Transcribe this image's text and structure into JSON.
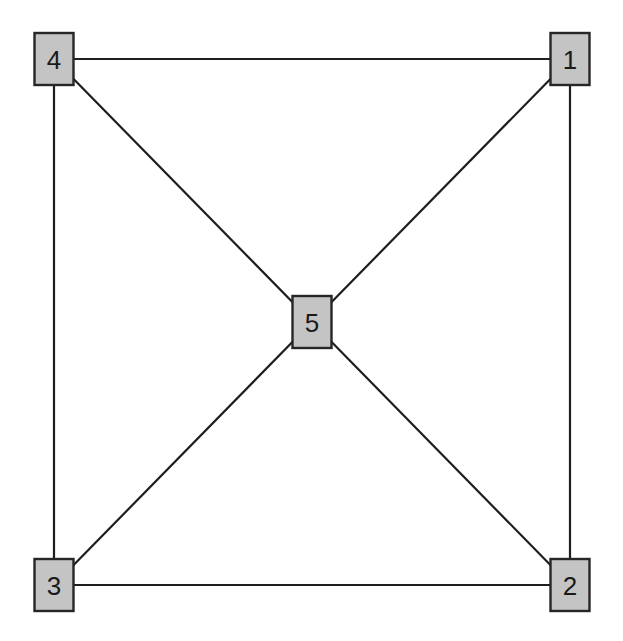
{
  "diagram": {
    "type": "graph",
    "colors": {
      "background": "#ffffff",
      "node_fill": "#c4c4c4",
      "node_stroke": "#262626",
      "edge": "#1e1e1e",
      "label": "#1a1a1a"
    },
    "nodes": [
      {
        "id": "1",
        "label": "1",
        "x": 570,
        "y": 59
      },
      {
        "id": "2",
        "label": "2",
        "x": 570,
        "y": 585
      },
      {
        "id": "3",
        "label": "3",
        "x": 54,
        "y": 585
      },
      {
        "id": "4",
        "label": "4",
        "x": 54,
        "y": 59
      },
      {
        "id": "5",
        "label": "5",
        "x": 312,
        "y": 322
      }
    ],
    "edges": [
      {
        "from": "4",
        "to": "1"
      },
      {
        "from": "1",
        "to": "2"
      },
      {
        "from": "2",
        "to": "3"
      },
      {
        "from": "3",
        "to": "4"
      },
      {
        "from": "4",
        "to": "5"
      },
      {
        "from": "1",
        "to": "5"
      },
      {
        "from": "3",
        "to": "5"
      },
      {
        "from": "2",
        "to": "5"
      }
    ]
  }
}
